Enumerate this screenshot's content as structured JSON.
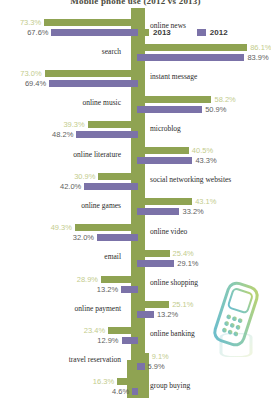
{
  "title": "Mobile phone use (2012 vs 2013)",
  "legend": {
    "items": [
      {
        "label": "2013",
        "color": "#8fa352"
      },
      {
        "label": "2012",
        "color": "#7b72a8"
      }
    ]
  },
  "icons": {
    "phone": "mobile-phone-icon"
  },
  "chart_data": {
    "type": "bar",
    "orientation": "horizontal-diverging",
    "title": "Mobile phone use (2012 vs 2013)",
    "xlabel": "",
    "ylabel": "",
    "xlim": [
      0,
      100
    ],
    "unit": "%",
    "grid": false,
    "legend_position": "top-right",
    "categories": [
      "online news",
      "search",
      "instant message",
      "online music",
      "microblog",
      "online literature",
      "social networking websites",
      "online games",
      "online video",
      "email",
      "online shopping",
      "online payment",
      "online banking",
      "travel reservation",
      "group buying"
    ],
    "series": [
      {
        "name": "2013",
        "color": "#8fa352",
        "values": [
          73.3,
          86.1,
          73.0,
          58.2,
          39.3,
          30.9,
          40.5,
          49.3,
          43.1,
          25.4,
          28.9,
          25.1,
          23.4,
          16.3,
          9.1
        ]
      },
      {
        "name": "2012",
        "color": "#7b72a8",
        "values": [
          67.6,
          83.9,
          69.4,
          50.9,
          48.2,
          42.0,
          43.3,
          32.0,
          33.2,
          29.1,
          13.2,
          13.2,
          12.9,
          4.6,
          5.9
        ]
      }
    ],
    "rows": [
      {
        "category": "online news",
        "side": "left",
        "v2013": "73.3%",
        "v2012": "67.6%",
        "n2013": 73.3,
        "n2012": 67.6
      },
      {
        "category": "search",
        "side": "right",
        "v2013": "86.1%",
        "v2012": "83.9%",
        "n2013": 86.1,
        "n2012": 83.9
      },
      {
        "category": "instant message",
        "side": "left",
        "v2013": "73.0%",
        "v2012": "69.4%",
        "n2013": 73.0,
        "n2012": 69.4
      },
      {
        "category": "online music",
        "side": "right",
        "v2013": "58.2%",
        "v2012": "50.9%",
        "n2013": 58.2,
        "n2012": 50.9
      },
      {
        "category": "microblog",
        "side": "left",
        "v2013": "39.3%",
        "v2012": "48.2%",
        "n2013": 39.3,
        "n2012": 48.2
      },
      {
        "category": "online literature",
        "side": "right",
        "v2013": "40.5%",
        "v2012": "43.3%",
        "n2013": 40.5,
        "n2012": 43.3
      },
      {
        "category": "social networking websites",
        "side": "left",
        "v2013": "30.9%",
        "v2012": "42.0%",
        "n2013": 30.9,
        "n2012": 42.0
      },
      {
        "category": "online games",
        "side": "right",
        "v2013": "43.1%",
        "v2012": "33.2%",
        "n2013": 43.1,
        "n2012": 33.2
      },
      {
        "category": "online video",
        "side": "left",
        "v2013": "49.3%",
        "v2012": "32.0%",
        "n2013": 49.3,
        "n2012": 32.0
      },
      {
        "category": "email",
        "side": "right",
        "v2013": "25.4%",
        "v2012": "29.1%",
        "n2013": 25.4,
        "n2012": 29.1
      },
      {
        "category": "online shopping",
        "side": "left",
        "v2013": "28.9%",
        "v2012": "13.2%",
        "n2013": 28.9,
        "n2012": 13.2
      },
      {
        "category": "online payment",
        "side": "right",
        "v2013": "25.1%",
        "v2012": "13.2%",
        "n2013": 25.1,
        "n2012": 13.2
      },
      {
        "category": "online banking",
        "side": "left",
        "v2013": "23.4%",
        "v2012": "12.9%",
        "n2013": 23.4,
        "n2012": 12.9
      },
      {
        "category": "travel reservation",
        "side": "right",
        "v2013": "9.1%",
        "v2012": "5.9%",
        "n2013": 9.1,
        "n2012": 5.9
      },
      {
        "category": "group buying",
        "side": "left",
        "v2013": "16.3%",
        "v2012": "4.6%",
        "n2013": 16.3,
        "n2012": 4.6
      }
    ]
  }
}
